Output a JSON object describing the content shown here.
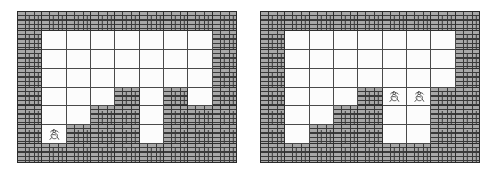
{
  "scene": {
    "title": "Brick Maze Grid Pair",
    "panel_count": 2,
    "colors": {
      "brick_fill": "#a8a8a8",
      "mortar": "#3a3a3a",
      "grid_line": "#4a4a4a",
      "background": "#ffffff",
      "empty_cell": "#fdfdfd"
    }
  },
  "panels": [
    {
      "name": "left-grid",
      "label": "Left Grid",
      "x": 17,
      "y": 11,
      "width": 220,
      "height": 152,
      "columns": 9,
      "rows": 7,
      "legend": {
        "brick": "wall / obstacle tile",
        "empty": "open floor tile",
        "sprite": "agent figure"
      },
      "cells": [
        [
          "brick",
          "brick",
          "brick",
          "brick",
          "brick",
          "brick",
          "brick",
          "brick",
          "brick"
        ],
        [
          "brick",
          "empty",
          "empty",
          "empty",
          "empty",
          "empty",
          "empty",
          "empty",
          "brick"
        ],
        [
          "brick",
          "empty",
          "empty",
          "empty",
          "empty",
          "empty",
          "empty",
          "empty",
          "brick"
        ],
        [
          "brick",
          "empty",
          "empty",
          "empty",
          "empty",
          "empty",
          "empty",
          "empty",
          "brick"
        ],
        [
          "brick",
          "empty",
          "empty",
          "empty",
          "brick",
          "empty",
          "brick",
          "empty",
          "brick"
        ],
        [
          "brick",
          "empty",
          "empty",
          "brick",
          "brick",
          "empty",
          "brick",
          "brick",
          "brick"
        ],
        [
          "brick",
          "empty",
          "brick",
          "brick",
          "brick",
          "empty",
          "brick",
          "brick",
          "brick"
        ],
        [
          "brick",
          "brick",
          "brick",
          "brick",
          "brick",
          "brick",
          "brick",
          "brick",
          "brick"
        ]
      ],
      "sprites": [
        {
          "name": "agent-figure",
          "row": 6,
          "col": 1,
          "glyph": "figure"
        }
      ]
    },
    {
      "name": "right-grid",
      "label": "Right Grid",
      "x": 260,
      "y": 11,
      "width": 220,
      "height": 152,
      "legend": {
        "brick": "wall / obstacle tile",
        "empty": "open floor tile",
        "sprite": "agent figure"
      },
      "columns": 9,
      "rows": 7,
      "cells": [
        [
          "brick",
          "brick",
          "brick",
          "brick",
          "brick",
          "brick",
          "brick",
          "brick",
          "brick"
        ],
        [
          "brick",
          "empty",
          "empty",
          "empty",
          "empty",
          "empty",
          "empty",
          "empty",
          "brick"
        ],
        [
          "brick",
          "empty",
          "empty",
          "empty",
          "empty",
          "empty",
          "empty",
          "empty",
          "brick"
        ],
        [
          "brick",
          "empty",
          "empty",
          "empty",
          "empty",
          "empty",
          "empty",
          "empty",
          "brick"
        ],
        [
          "brick",
          "empty",
          "empty",
          "empty",
          "brick",
          "empty",
          "empty",
          "brick",
          "brick"
        ],
        [
          "brick",
          "empty",
          "empty",
          "brick",
          "brick",
          "empty",
          "empty",
          "brick",
          "brick"
        ],
        [
          "brick",
          "empty",
          "brick",
          "brick",
          "brick",
          "empty",
          "empty",
          "brick",
          "brick"
        ],
        [
          "brick",
          "brick",
          "brick",
          "brick",
          "brick",
          "brick",
          "brick",
          "brick",
          "brick"
        ]
      ],
      "sprites": [
        {
          "name": "agent-figure-a",
          "row": 4,
          "col": 5,
          "glyph": "figure"
        },
        {
          "name": "agent-figure-b",
          "row": 4,
          "col": 6,
          "glyph": "figure"
        }
      ]
    }
  ]
}
